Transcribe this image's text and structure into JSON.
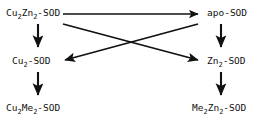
{
  "diagram": {
    "type": "reaction-scheme",
    "background_color": "#ffffff",
    "stroke_color": "#111111",
    "nodes": {
      "cu2zn2_sod": {
        "text": "Cu2Zn2-SOD",
        "main1": "Cu",
        "sub1": "2",
        "main2": "Zn",
        "sub2": "2",
        "tail": "-SOD"
      },
      "apo_sod": {
        "text": "apo-SOD"
      },
      "cu2_sod": {
        "text": "Cu2-SOD",
        "main1": "Cu",
        "sub1": "2",
        "tail": "-SOD"
      },
      "zn2_sod": {
        "text": "Zn2-SOD",
        "main1": "Zn",
        "sub1": "2",
        "tail": "-SOD"
      },
      "cu2me2_sod": {
        "text": "Cu2Me2-SOD",
        "main1": "Cu",
        "sub1": "2",
        "main2": "Me",
        "sub2": "2",
        "tail": "-SOD"
      },
      "me2zn2_sod": {
        "text": "Me2Zn2-SOD",
        "main1": "Me",
        "sub1": "2",
        "main2": "Zn",
        "sub2": "2",
        "tail": "-SOD"
      }
    },
    "edges": [
      {
        "name": "cu2zn2-to-apo",
        "from": "cu2zn2_sod",
        "to": "apo_sod",
        "direction": "right"
      },
      {
        "name": "cu2zn2-to-cu2",
        "from": "cu2zn2_sod",
        "to": "cu2_sod",
        "direction": "down"
      },
      {
        "name": "cu2-to-cu2me2",
        "from": "cu2_sod",
        "to": "cu2me2_sod",
        "direction": "down"
      },
      {
        "name": "apo-to-zn2",
        "from": "apo_sod",
        "to": "zn2_sod",
        "direction": "down"
      },
      {
        "name": "zn2-to-me2zn2",
        "from": "zn2_sod",
        "to": "me2zn2_sod",
        "direction": "down"
      },
      {
        "name": "cu2zn2-to-zn2-diagonal",
        "from": "cu2zn2_sod",
        "to": "zn2_sod",
        "direction": "diagonal-down-right"
      },
      {
        "name": "apo-to-cu2-diagonal",
        "from": "apo_sod",
        "to": "cu2_sod",
        "direction": "diagonal-down-left"
      }
    ]
  }
}
